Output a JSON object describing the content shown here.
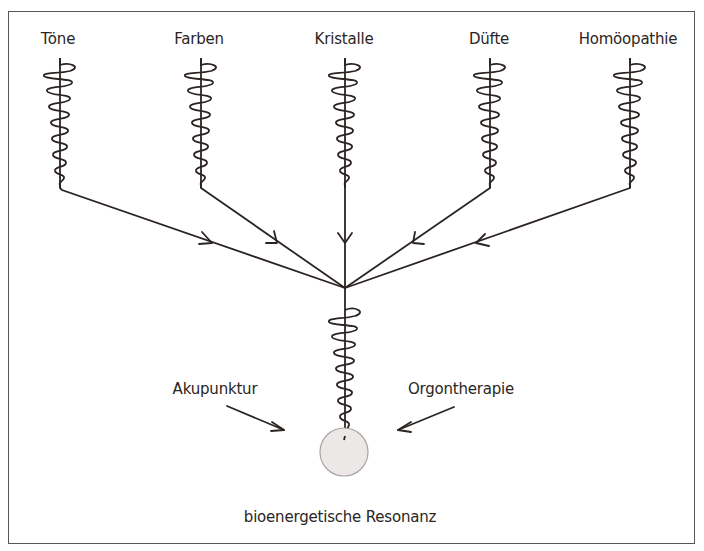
{
  "diagram": {
    "title": "",
    "sources": [
      {
        "label": "Töne",
        "x": 58
      },
      {
        "label": "Farben",
        "x": 199
      },
      {
        "label": "Kristalle",
        "x": 344
      },
      {
        "label": "Düfte",
        "x": 490
      },
      {
        "label": "Homöopathie",
        "x": 629
      }
    ],
    "side_inputs": [
      {
        "label": "Akupunktur"
      },
      {
        "label": "Orgontherapie"
      }
    ],
    "target": {
      "label": "bioenergetische Resonanz"
    },
    "colors": {
      "line": "#2b2422",
      "frame": "#5a5552",
      "circle_fill": "#ebe8e7",
      "circle_stroke": "#a8a3a1"
    }
  }
}
